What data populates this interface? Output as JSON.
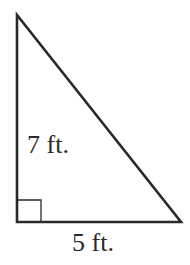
{
  "figure": {
    "type": "right-triangle",
    "stroke_color": "#2a2a2a",
    "background": "#ffffff",
    "vertices": {
      "top": [
        17,
        15
      ],
      "bottom_left": [
        17,
        222
      ],
      "bottom_right": [
        181,
        222
      ]
    },
    "right_angle_marker": {
      "corner": "bottom_left",
      "size": 24
    },
    "labels": {
      "vertical_side": "7 ft.",
      "horizontal_side": "5 ft."
    }
  }
}
